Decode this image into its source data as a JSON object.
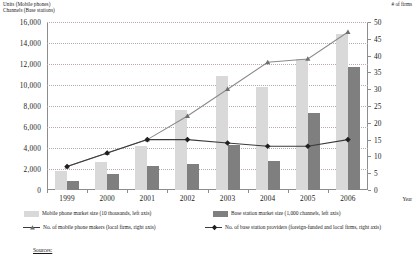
{
  "axes": {
    "left_title_line1": "Units (Mobile phones)",
    "left_title_line2": "Channels (Base stations)",
    "right_title": "# of firms",
    "x_title": "Year"
  },
  "legend": {
    "items": [
      {
        "key": "mobile-market",
        "marker": "light-swatch",
        "label": "Mobile phone market size (10 thousands, left axis)"
      },
      {
        "key": "base-market",
        "marker": "dark-swatch",
        "label": "Base station market size (1,000 channels, left axis)"
      },
      {
        "key": "mobile-makers",
        "marker": "triangle-line",
        "label": "No. of mobile phone makers (local firms, right axis)"
      },
      {
        "key": "base-providers",
        "marker": "diamond-line",
        "label": "No. of base station providers (foreign-funded and local firms, right axis)"
      }
    ]
  },
  "footer": {
    "sources_label": "Sources:"
  },
  "colors": {
    "bar_light": "#d9d9d9",
    "bar_dark": "#7f7f7f",
    "line_dark": "#3a3a3a",
    "line_gray": "#8c8c8c",
    "grid": "#b9a9a9",
    "axis": "#8d8d8d"
  },
  "chart_data": {
    "type": "bar",
    "title": "",
    "subtitle": "",
    "xlabel": "Year",
    "ylabel": "Units (Mobile phones) / Channels (Base stations)",
    "y2label": "# of firms",
    "categories": [
      "1999",
      "2000",
      "2001",
      "2002",
      "2003",
      "2004",
      "2005",
      "2006"
    ],
    "ylim": [
      0,
      16000
    ],
    "yticks": [
      0,
      2000,
      4000,
      6000,
      8000,
      10000,
      12000,
      14000,
      16000
    ],
    "ytick_labels": [
      "0",
      "2,000",
      "4,000",
      "6,000",
      "8,000",
      "10,000",
      "12,000",
      "14,000",
      "16,000"
    ],
    "y2lim": [
      0,
      50
    ],
    "y2ticks": [
      0,
      5,
      10,
      15,
      20,
      25,
      30,
      35,
      40,
      45,
      50
    ],
    "y2tick_labels": [
      "0",
      "5",
      "10",
      "15",
      "20",
      "25",
      "30",
      "35",
      "40",
      "45",
      "50"
    ],
    "grid": true,
    "legend_position": "bottom",
    "series": [
      {
        "name": "Mobile phone market size (10 thousands, left axis)",
        "type": "bar",
        "axis": "left",
        "color": "#d9d9d9",
        "values": [
          1800,
          2700,
          4200,
          7600,
          10900,
          9800,
          12500,
          14900
        ]
      },
      {
        "name": "Base station market size (1,000 channels, left axis)",
        "type": "bar",
        "axis": "left",
        "color": "#7f7f7f",
        "values": [
          900,
          1500,
          2300,
          2500,
          4300,
          2800,
          7300,
          11700
        ]
      },
      {
        "name": "No. of mobile phone makers (local firms, right axis)",
        "type": "line",
        "axis": "right",
        "marker": "triangle",
        "color": "#8c8c8c",
        "values": [
          7,
          11,
          15,
          22,
          30,
          38,
          39,
          47
        ]
      },
      {
        "name": "No. of base station providers (foreign-funded and local firms, right axis)",
        "type": "line",
        "axis": "right",
        "marker": "diamond",
        "color": "#3a3a3a",
        "values": [
          7,
          11,
          15,
          15,
          14,
          13,
          13,
          15
        ]
      }
    ]
  }
}
